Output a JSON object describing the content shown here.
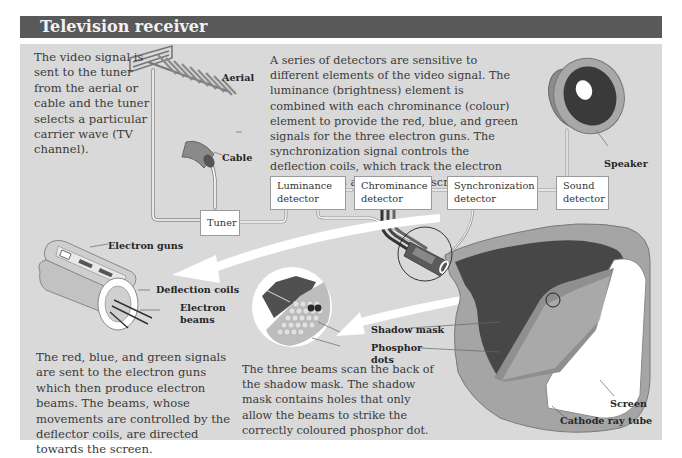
{
  "header": {
    "title": "Television receiver"
  },
  "texts": {
    "intro_left": "The video signal is sent to the tuner from the aerial or cable and the tuner selects a particular carrier wave (TV channel).",
    "detectors": "A series of detectors are sensitive to different elements of the video signal. The luminance (brightness) element is combined with each chrominance (colour) element to provide the red, blue, and green signals for the three electron guns. The synchronization signal controls the deflection coils, which track the electron beams across and down the screen.",
    "guns": "The red, blue, and green signals are sent to the electron guns which then produce electron beams. The beams, whose movements are controlled by the deflector coils, are directed towards the screen.",
    "shadow_mask": "The three beams scan the back of the shadow mask. The shadow mask contains holes that only allow the beams to strike the correctly coloured phosphor dot."
  },
  "labels": {
    "aerial": "Aerial",
    "cable": "Cable",
    "speaker": "Speaker",
    "electron_guns": "Electron guns",
    "deflection_coils": "Deflection coils",
    "electron_beams_1": "Electron",
    "electron_beams_2": "beams",
    "shadow_mask": "Shadow mask",
    "phosphor_dots_1": "Phosphor",
    "phosphor_dots_2": "dots",
    "screen": "Screen",
    "cathode_ray_tube": "Cathode ray tube"
  },
  "boxes": {
    "tuner": "Tuner",
    "luminance": [
      "Luminance",
      "detector"
    ],
    "chrominance": [
      "Chrominance",
      "detector"
    ],
    "synchronization": [
      "Synchronization",
      "detector"
    ],
    "sound": [
      "Sound",
      "detector"
    ]
  },
  "colors": {
    "header_bg": "#595959",
    "panel_bg": "#d9d9d9",
    "dark_fill": "#4a4a4a",
    "mid_fill": "#9a9a9a",
    "white": "#ffffff"
  }
}
